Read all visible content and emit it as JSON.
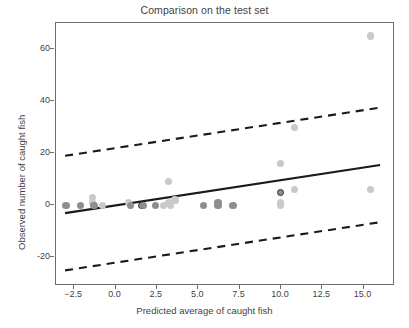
{
  "chart_data": {
    "type": "scatter",
    "title": "Comparison on the test set",
    "xlabel": "Predicted average of caught fish",
    "ylabel": "Observed number of caught fish",
    "xlim": [
      -3.6,
      16.9
    ],
    "ylim": [
      -31,
      70
    ],
    "grid": false,
    "legend": null,
    "xticks": [
      -2.5,
      0.0,
      2.5,
      5.0,
      7.5,
      10.0,
      12.5,
      15.0
    ],
    "xticklabels": [
      "-2.5",
      "0.0",
      "2.5",
      "5.0",
      "7.5",
      "10.0",
      "12.5",
      "15.0"
    ],
    "yticks": [
      -20,
      0,
      20,
      40,
      60
    ],
    "yticklabels": [
      "-20",
      "0",
      "20",
      "40",
      "60"
    ],
    "points": [
      {
        "x": -3.0,
        "y": 0,
        "shade": "dark"
      },
      {
        "x": -2.1,
        "y": 0,
        "shade": "dark"
      },
      {
        "x": -1.4,
        "y": 3,
        "shade": "light"
      },
      {
        "x": -1.4,
        "y": 1,
        "shade": "light"
      },
      {
        "x": -1.3,
        "y": 0,
        "shade": "dark"
      },
      {
        "x": -0.8,
        "y": 0,
        "shade": "light"
      },
      {
        "x": 0.8,
        "y": 1,
        "shade": "light"
      },
      {
        "x": 0.9,
        "y": 0,
        "shade": "dark"
      },
      {
        "x": 1.6,
        "y": 0,
        "shade": "outlined"
      },
      {
        "x": 1.7,
        "y": 0,
        "shade": "dark"
      },
      {
        "x": 2.4,
        "y": 0,
        "shade": "dark"
      },
      {
        "x": 2.9,
        "y": 0,
        "shade": "light"
      },
      {
        "x": 3.2,
        "y": 9,
        "shade": "light"
      },
      {
        "x": 3.2,
        "y": 1,
        "shade": "light"
      },
      {
        "x": 3.3,
        "y": 0,
        "shade": "light"
      },
      {
        "x": 3.6,
        "y": 2,
        "shade": "light"
      },
      {
        "x": 5.3,
        "y": 0,
        "shade": "dark"
      },
      {
        "x": 6.2,
        "y": 1,
        "shade": "dark"
      },
      {
        "x": 6.2,
        "y": 0,
        "shade": "dark"
      },
      {
        "x": 7.1,
        "y": 0,
        "shade": "dark"
      },
      {
        "x": 10.0,
        "y": 16,
        "shade": "light"
      },
      {
        "x": 10.0,
        "y": 5,
        "shade": "outlined"
      },
      {
        "x": 10.0,
        "y": 1,
        "shade": "light"
      },
      {
        "x": 10.0,
        "y": 0,
        "shade": "light"
      },
      {
        "x": 10.8,
        "y": 30,
        "shade": "light"
      },
      {
        "x": 10.8,
        "y": 6,
        "shade": "light"
      },
      {
        "x": 15.4,
        "y": 65,
        "shade": "light"
      },
      {
        "x": 15.4,
        "y": 6,
        "shade": "light"
      }
    ],
    "fit_line": {
      "name": "regression-line",
      "style": "solid",
      "x": [
        -3.05,
        16.0
      ],
      "y": [
        -3.0,
        15.5
      ]
    },
    "interval_lines": [
      {
        "name": "upper-prediction-band",
        "style": "dashed",
        "x": [
          -3.05,
          16.0
        ],
        "y": [
          19.0,
          37.5
        ]
      },
      {
        "name": "lower-prediction-band",
        "style": "dashed",
        "x": [
          -3.05,
          16.0
        ],
        "y": [
          -25.0,
          -6.5
        ]
      }
    ],
    "colors": {
      "point_light": "#c9c9c9",
      "point_dark": "#8e8e8e",
      "point_outline": "#2b2b2b",
      "line": "#1a1a1a",
      "axis": "#6e6e6e",
      "text": "#3f3f3f"
    }
  }
}
